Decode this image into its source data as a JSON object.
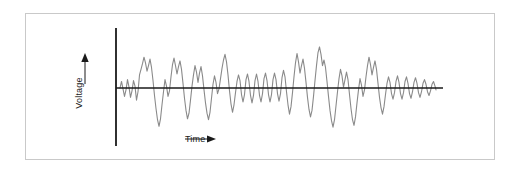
{
  "figure": {
    "background_color": "#ffffff",
    "border_color": "#c9c9c9",
    "axis_color": "#1a1a1a",
    "waveform_color": "#8a8a8a"
  },
  "labels": {
    "y_axis": "Voltage",
    "y_axis_arrow": "up-arrow-icon",
    "x_axis": "Time",
    "x_axis_arrow": "right-arrow-icon"
  },
  "chart_data": {
    "type": "line",
    "title": "",
    "xlabel": "Time",
    "ylabel": "Voltage",
    "grid": false,
    "legend": null,
    "tick_labels": {
      "x": [],
      "y": []
    },
    "axis_origin_x": 116,
    "baseline_y": 88,
    "axis_top_y": 28,
    "axis_bottom_y": 146,
    "baseline_end_x": 443,
    "waveform_start_x": 120,
    "waveform_end_x": 436,
    "ylim": [
      -45,
      45
    ],
    "points": [
      [
        120,
        0
      ],
      [
        121.5,
        7
      ],
      [
        123,
        -1
      ],
      [
        124.5,
        -9
      ],
      [
        126,
        -2
      ],
      [
        127.5,
        9
      ],
      [
        129,
        1
      ],
      [
        130.5,
        -10
      ],
      [
        132,
        -3
      ],
      [
        133.5,
        8
      ],
      [
        135,
        2
      ],
      [
        136.5,
        -13
      ],
      [
        138,
        -4
      ],
      [
        139.5,
        14
      ],
      [
        141,
        20
      ],
      [
        142.5,
        26
      ],
      [
        144,
        33
      ],
      [
        145.5,
        27
      ],
      [
        147,
        18
      ],
      [
        148.5,
        24
      ],
      [
        150,
        31
      ],
      [
        151.5,
        22
      ],
      [
        153,
        8
      ],
      [
        154.5,
        -8
      ],
      [
        156,
        -22
      ],
      [
        157.5,
        -34
      ],
      [
        159,
        -41
      ],
      [
        160.5,
        -33
      ],
      [
        162,
        -18
      ],
      [
        163.5,
        -4
      ],
      [
        165,
        9
      ],
      [
        166.5,
        2
      ],
      [
        168,
        -9
      ],
      [
        169.5,
        -3
      ],
      [
        171,
        12
      ],
      [
        172.5,
        25
      ],
      [
        174,
        32
      ],
      [
        175.5,
        24
      ],
      [
        177,
        15
      ],
      [
        178.5,
        23
      ],
      [
        180,
        29
      ],
      [
        181.5,
        20
      ],
      [
        183,
        5
      ],
      [
        184.5,
        -11
      ],
      [
        186,
        -24
      ],
      [
        187.5,
        -33
      ],
      [
        189,
        -27
      ],
      [
        190.5,
        -13
      ],
      [
        192,
        2
      ],
      [
        193.5,
        14
      ],
      [
        195,
        24
      ],
      [
        196.5,
        17
      ],
      [
        198,
        6
      ],
      [
        199.5,
        16
      ],
      [
        201,
        23
      ],
      [
        202.5,
        13
      ],
      [
        204,
        -2
      ],
      [
        205.5,
        -16
      ],
      [
        207,
        -27
      ],
      [
        208.5,
        -34
      ],
      [
        210,
        -26
      ],
      [
        211.5,
        -11
      ],
      [
        213,
        4
      ],
      [
        214.5,
        13
      ],
      [
        216,
        6
      ],
      [
        217.5,
        -6
      ],
      [
        219,
        -1
      ],
      [
        220.5,
        10
      ],
      [
        222,
        21
      ],
      [
        223.5,
        30
      ],
      [
        225,
        36
      ],
      [
        226.5,
        28
      ],
      [
        228,
        14
      ],
      [
        229.5,
        -3
      ],
      [
        231,
        -17
      ],
      [
        232.5,
        -26
      ],
      [
        234,
        -18
      ],
      [
        235.5,
        -5
      ],
      [
        237,
        7
      ],
      [
        238.5,
        14
      ],
      [
        240,
        8
      ],
      [
        241.5,
        -7
      ],
      [
        243,
        -15
      ],
      [
        244.5,
        -7
      ],
      [
        246,
        9
      ],
      [
        247.5,
        15
      ],
      [
        249,
        7
      ],
      [
        250.5,
        -8
      ],
      [
        252,
        -16
      ],
      [
        253.5,
        -8
      ],
      [
        255,
        8
      ],
      [
        256.5,
        15
      ],
      [
        258,
        7
      ],
      [
        259.5,
        -8
      ],
      [
        261,
        -15
      ],
      [
        262.5,
        -6
      ],
      [
        264,
        10
      ],
      [
        265.5,
        16
      ],
      [
        267,
        8
      ],
      [
        268.5,
        -7
      ],
      [
        270,
        -15
      ],
      [
        271.5,
        -7
      ],
      [
        273,
        9
      ],
      [
        274.5,
        16
      ],
      [
        276,
        9
      ],
      [
        277.5,
        -6
      ],
      [
        279,
        -14
      ],
      [
        280.5,
        -6
      ],
      [
        282,
        11
      ],
      [
        283.5,
        19
      ],
      [
        285,
        12
      ],
      [
        286.5,
        -4
      ],
      [
        288,
        -18
      ],
      [
        289.5,
        -28
      ],
      [
        291,
        -20
      ],
      [
        292.5,
        -5
      ],
      [
        294,
        12
      ],
      [
        295.5,
        27
      ],
      [
        297,
        37
      ],
      [
        298.5,
        28
      ],
      [
        300,
        16
      ],
      [
        301.5,
        24
      ],
      [
        303,
        31
      ],
      [
        304.5,
        21
      ],
      [
        306,
        6
      ],
      [
        307.5,
        -10
      ],
      [
        309,
        -23
      ],
      [
        310.5,
        -31
      ],
      [
        312,
        -24
      ],
      [
        313.5,
        -9
      ],
      [
        315,
        8
      ],
      [
        316.5,
        24
      ],
      [
        318,
        38
      ],
      [
        319.5,
        44
      ],
      [
        321,
        36
      ],
      [
        322.5,
        24
      ],
      [
        324,
        30
      ],
      [
        325.5,
        22
      ],
      [
        327,
        7
      ],
      [
        328.5,
        -9
      ],
      [
        330,
        -24
      ],
      [
        331.5,
        -35
      ],
      [
        333,
        -42
      ],
      [
        334.5,
        -34
      ],
      [
        336,
        -19
      ],
      [
        337.5,
        -4
      ],
      [
        339,
        10
      ],
      [
        340.5,
        20
      ],
      [
        342,
        13
      ],
      [
        343.5,
        1
      ],
      [
        345,
        9
      ],
      [
        346.5,
        17
      ],
      [
        348,
        9
      ],
      [
        349.5,
        -7
      ],
      [
        351,
        -22
      ],
      [
        352.5,
        -34
      ],
      [
        354,
        -40
      ],
      [
        355.5,
        -31
      ],
      [
        357,
        -16
      ],
      [
        358.5,
        -2
      ],
      [
        360,
        10
      ],
      [
        361.5,
        3
      ],
      [
        363,
        -9
      ],
      [
        364.5,
        -2
      ],
      [
        366,
        12
      ],
      [
        367.5,
        24
      ],
      [
        369,
        33
      ],
      [
        370.5,
        25
      ],
      [
        372,
        14
      ],
      [
        373.5,
        22
      ],
      [
        375,
        29
      ],
      [
        376.5,
        20
      ],
      [
        378,
        5
      ],
      [
        379.5,
        -10
      ],
      [
        381,
        -21
      ],
      [
        382.5,
        -28
      ],
      [
        384,
        -20
      ],
      [
        385.5,
        -7
      ],
      [
        387,
        5
      ],
      [
        388.5,
        12
      ],
      [
        390,
        6
      ],
      [
        391.5,
        -6
      ],
      [
        393,
        -12
      ],
      [
        394.5,
        -5
      ],
      [
        396,
        7
      ],
      [
        397.5,
        13
      ],
      [
        399,
        6
      ],
      [
        400.5,
        -6
      ],
      [
        402,
        -12
      ],
      [
        403.5,
        -5
      ],
      [
        405,
        7
      ],
      [
        406.5,
        12
      ],
      [
        408,
        5
      ],
      [
        409.5,
        -6
      ],
      [
        411,
        -11
      ],
      [
        412.5,
        -4
      ],
      [
        414,
        6
      ],
      [
        415.5,
        11
      ],
      [
        417,
        5
      ],
      [
        418.5,
        -5
      ],
      [
        420,
        -10
      ],
      [
        421.5,
        -4
      ],
      [
        423,
        5
      ],
      [
        424.5,
        9
      ],
      [
        426,
        4
      ],
      [
        427.5,
        -4
      ],
      [
        429,
        -8
      ],
      [
        430.5,
        -3
      ],
      [
        432,
        4
      ],
      [
        433.5,
        7
      ],
      [
        435,
        2
      ],
      [
        436,
        -2
      ]
    ]
  }
}
